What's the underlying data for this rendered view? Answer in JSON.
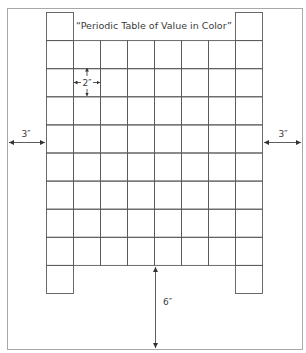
{
  "title": "“Periodic Table of Value in Color”",
  "grid": {
    "end_column_rows": 10,
    "middle_columns": 6,
    "middle_column_rows": 8,
    "total_columns": 8
  },
  "dimensions": {
    "cell_size": "2″",
    "left_margin": "3″",
    "right_margin": "3″",
    "bottom_margin": "6″"
  },
  "colors": {
    "grid_line": "#5a5a5a",
    "border_line": "#a8a8a8",
    "arrow": "#333333"
  }
}
